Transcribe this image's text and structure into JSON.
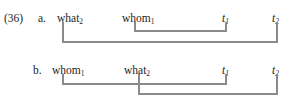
{
  "figure": {
    "example_number": "(36)",
    "rows": [
      {
        "id": "a",
        "label": "a.",
        "tokens": [
          {
            "name": "token-what-a",
            "text": "what",
            "sub": "2",
            "x": 57,
            "y": 12
          },
          {
            "name": "token-whom-a",
            "text": "whom",
            "sub": "1",
            "x": 122,
            "y": 12
          },
          {
            "name": "token-t1-a",
            "text": "t",
            "sub": "1",
            "x": 222,
            "y": 12,
            "italic": true
          },
          {
            "name": "token-t2-a",
            "text": "t",
            "sub": "2",
            "x": 272,
            "y": 12,
            "italic": true
          }
        ],
        "links": [
          {
            "name": "dependency-link-whom1-t1",
            "from_x": 135,
            "to_x": 226,
            "top_y": 22,
            "bar_y": 31
          },
          {
            "name": "dependency-link-what2-t2",
            "from_x": 63,
            "to_x": 277,
            "top_y": 22,
            "bar_y": 42
          }
        ]
      },
      {
        "id": "b",
        "label": "b.",
        "tokens": [
          {
            "name": "token-whom-b",
            "text": "whom",
            "sub": "1",
            "x": 52,
            "y": 64
          },
          {
            "name": "token-what-b",
            "text": "what",
            "sub": "2",
            "x": 124,
            "y": 64
          },
          {
            "name": "token-t1-b",
            "text": "t",
            "sub": "1",
            "x": 222,
            "y": 64,
            "italic": true
          },
          {
            "name": "token-t2-b",
            "text": "t",
            "sub": "2",
            "x": 272,
            "y": 64,
            "italic": true
          }
        ],
        "links": [
          {
            "name": "dependency-link-whom1-t1",
            "from_x": 63,
            "to_x": 226,
            "top_y": 74,
            "bar_y": 84
          },
          {
            "name": "dependency-link-what2-t2",
            "from_x": 139,
            "to_x": 277,
            "top_y": 74,
            "bar_y": 94
          }
        ]
      }
    ],
    "example_number_pos": {
      "x": 4,
      "y": 12
    },
    "row_label_pos": [
      {
        "x": 38,
        "y": 12
      },
      {
        "x": 33,
        "y": 64
      }
    ],
    "line_color": "#8a8a8a",
    "text_color": "#1d1d1d",
    "background_color": "#ffffff"
  }
}
